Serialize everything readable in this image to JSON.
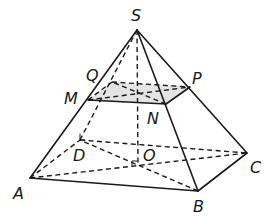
{
  "diagram": {
    "type": "geometry-3d-pyramid",
    "points": {
      "S": {
        "x": 137,
        "y": 30
      },
      "A": {
        "x": 30,
        "y": 178
      },
      "B": {
        "x": 198,
        "y": 191
      },
      "C": {
        "x": 247,
        "y": 153
      },
      "D": {
        "x": 80,
        "y": 140
      },
      "O": {
        "x": 138,
        "y": 166
      },
      "M": {
        "x": 88,
        "y": 100
      },
      "N": {
        "x": 166,
        "y": 104
      },
      "P": {
        "x": 190,
        "y": 87
      },
      "Q": {
        "x": 112,
        "y": 82
      },
      "I": {
        "x": 138,
        "y": 92
      }
    },
    "labels": {
      "S": "S",
      "A": "A",
      "B": "B",
      "C": "C",
      "D": "D",
      "O": "O",
      "M": "M",
      "N": "N",
      "P": "P",
      "Q": "Q"
    },
    "solid_edges": [
      "SA",
      "SB",
      "SC",
      "AB",
      "BC",
      "MN",
      "NP"
    ],
    "dashed_edges": [
      "SD",
      "SO",
      "AD",
      "DC",
      "AC",
      "BD",
      "MQ",
      "QP",
      "MP",
      "NQ"
    ],
    "shaded_section": "MNPQ",
    "colors": {
      "line": "#1a1a1a",
      "section_fill": "#e4e4e4",
      "background": "#ffffff"
    }
  }
}
